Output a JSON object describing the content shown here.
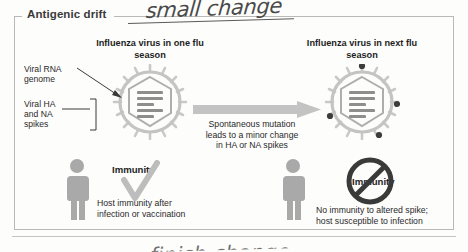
{
  "panel": {
    "title": "Antigenic drift",
    "annotation": "small change",
    "annotation_bottom": "finish change"
  },
  "left_column": {
    "heading": "Influenza virus in\none flu season",
    "labels": [
      {
        "name": "viral-rna-genome",
        "text": "Viral RNA\ngenome"
      },
      {
        "name": "viral-ha-na-spikes",
        "text": "Viral HA\nand NA\nspikes"
      }
    ],
    "immunity_status": "Immunity",
    "immunity_mark": "check-mark",
    "immunity_caption": "Host immunity after\ninfection or vaccination"
  },
  "center": {
    "arrow": "right-arrow",
    "caption": "Spontaneous mutation\nleads to a minor change\nin HA or NA spikes"
  },
  "right_column": {
    "heading": "Influenza virus in\nnext flu season",
    "immunity_status": "Immunity",
    "immunity_mark": "no-entry-sign",
    "immunity_caption": "No immunity to altered spike;\nhost susceptible to infection"
  },
  "colors": {
    "virus_body": "#c9c9c9",
    "virus_capsid": "#a8a8a8",
    "rna_segment": "#8e8e8e",
    "altered_spike": "#3d3d3d",
    "arrow": "#c3c3c3",
    "person": "#a9a9a9",
    "check": "#b5b5b5",
    "no_sign": "#3a3a3a",
    "panel_border": "#b9b9b9",
    "text": "#2a2a2a"
  }
}
